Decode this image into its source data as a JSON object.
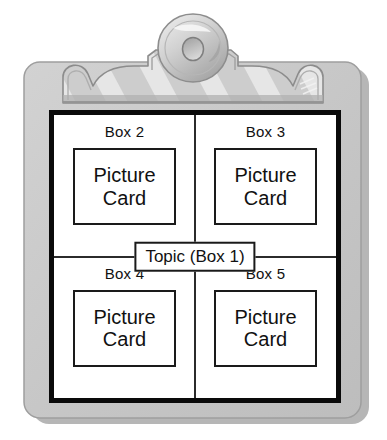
{
  "illustration": {
    "subject": "clipboard-with-topic-web-diagram",
    "colors": {
      "board": "#c8c8c8",
      "board_edge": "#9a9a9a",
      "board_shadow": "#b4b4b4",
      "clip_light": "#e2e2e2",
      "clip_mid": "#b9b9b9",
      "clip_dark": "#8f8f8f",
      "knob_light": "#e8e8e8",
      "knob_dark": "#9b9b9b",
      "paper": "#ffffff",
      "frame": "#0a0a0a",
      "line": "#2b2b2b",
      "text": "#111111"
    }
  },
  "clip": {
    "knob_name": "clip-knob",
    "band_name": "clip-band",
    "stripes": 7
  },
  "diagram": {
    "center": {
      "label": "Topic (Box 1)"
    },
    "quadrants": [
      {
        "position": "top-left",
        "label": "Box 2",
        "card_line1": "Picture",
        "card_line2": "Card"
      },
      {
        "position": "top-right",
        "label": "Box 3",
        "card_line1": "Picture",
        "card_line2": "Card"
      },
      {
        "position": "bottom-left",
        "label": "Box 4",
        "card_line1": "Picture",
        "card_line2": "Card"
      },
      {
        "position": "bottom-right",
        "label": "Box 5",
        "card_line1": "Picture",
        "card_line2": "Card"
      }
    ]
  }
}
